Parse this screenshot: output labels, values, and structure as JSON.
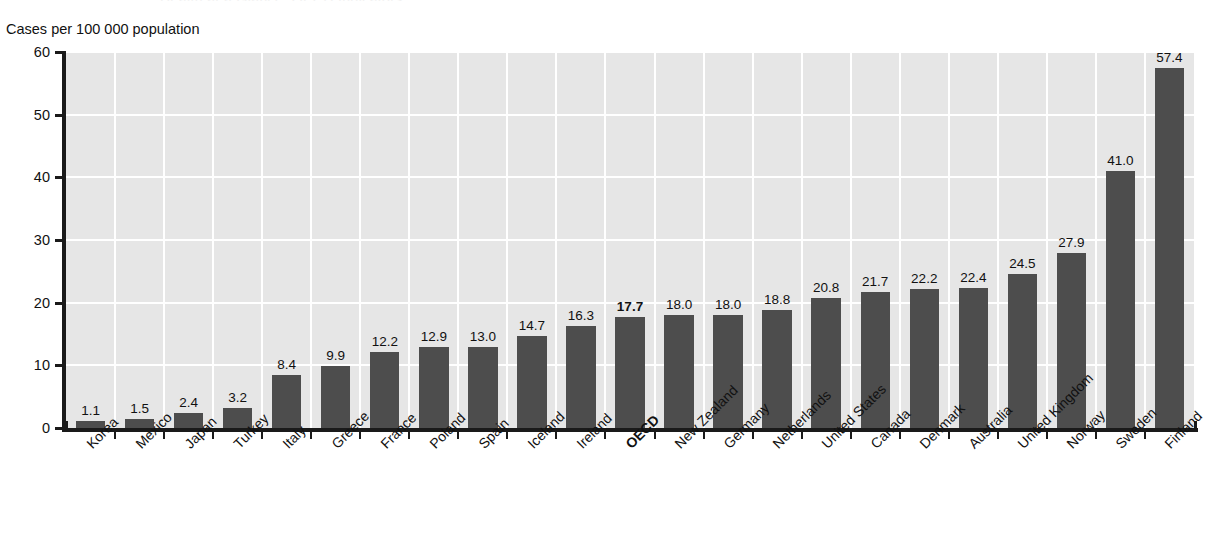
{
  "figure": {
    "title_remnant": "Health at a Glance: OECD Indicators",
    "y_axis_caption": "Cases per 100 000 population"
  },
  "chart_data": {
    "type": "bar",
    "title": "",
    "subtitle": "",
    "xlabel": "",
    "ylabel": "Cases per 100 000 population",
    "ylim": [
      0,
      60
    ],
    "yticks": [
      0,
      10,
      20,
      30,
      40,
      50,
      60
    ],
    "ytick_labels": [
      "0",
      "10",
      "20",
      "30",
      "40",
      "50",
      "60"
    ],
    "grid": "horizontal-and-vertical-white-on-gray",
    "legend": "none",
    "bar_color": "#4d4d4d",
    "plot_background": "#e6e6e6",
    "gridline_color": "#ffffff",
    "axis_color": "#1a1a1a",
    "highlight_category": "OECD",
    "categories": [
      "Korea",
      "Mexico",
      "Japan",
      "Turkey",
      "Italy",
      "Greece",
      "France",
      "Poland",
      "Spain",
      "Iceland",
      "Ireland",
      "OECD",
      "New Zealand",
      "Germany",
      "Netherlands",
      "United States",
      "Canada",
      "Denmark",
      "Australia",
      "United Kingdom",
      "Norway",
      "Sweden",
      "Finland"
    ],
    "values": [
      1.1,
      1.5,
      2.4,
      3.2,
      8.4,
      9.9,
      12.2,
      12.9,
      13.0,
      14.7,
      16.3,
      17.7,
      18.0,
      18.0,
      18.8,
      20.8,
      21.7,
      22.2,
      22.4,
      24.5,
      27.9,
      41.0,
      57.4
    ],
    "value_labels": [
      "1.1",
      "1.5",
      "2.4",
      "3.2",
      "8.4",
      "9.9",
      "12.2",
      "12.9",
      "13.0",
      "14.7",
      "16.3",
      "17.7",
      "18.0",
      "18.0",
      "18.8",
      "20.8",
      "21.7",
      "22.2",
      "22.4",
      "24.5",
      "27.9",
      "41.0",
      "57.4"
    ]
  }
}
